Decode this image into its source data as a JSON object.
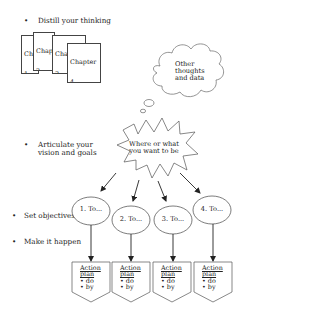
{
  "bullets": [
    {
      "label": "Distill your thinking"
    },
    {
      "label": "Articulate your",
      "label2": "vision and goals"
    },
    {
      "label": "Set objectives"
    },
    {
      "label": "Make it happen"
    }
  ],
  "bullet_glyph": "•",
  "chapters": [
    {
      "title": "Chapter",
      "number": "1",
      "lines": [
        "•",
        "•"
      ]
    },
    {
      "title": "Chapter",
      "number": "2",
      "lines": [
        "•",
        "•"
      ]
    },
    {
      "title": "Chapter",
      "number": "3",
      "lines": [
        "•",
        "•"
      ]
    },
    {
      "title": "Chapter",
      "number": "4",
      "notes": "Notes:",
      "lines": [
        "•"
      ]
    }
  ],
  "thought_cloud": {
    "line1": "Other",
    "line2": "thoughts",
    "line3": "and data"
  },
  "vision_burst": {
    "line1": "Where or what",
    "line2": "you want to be"
  },
  "objectives": [
    {
      "label": "1. To..."
    },
    {
      "label": "2. To..."
    },
    {
      "label": "3. To..."
    },
    {
      "label": "4. To..."
    }
  ],
  "action_plans": [
    {
      "title1": "Action",
      "title2": "plan",
      "item1": "• do",
      "item2": "• by"
    },
    {
      "title1": "Action",
      "title2": "plan",
      "item1": "• do",
      "item2": "• by"
    },
    {
      "title1": "Action",
      "title2": "plan",
      "item1": "• do",
      "item2": "• by"
    },
    {
      "title1": "Action",
      "title2": "plan",
      "item1": "• do",
      "item2": "• by"
    }
  ],
  "colors": {
    "stroke": "#444444",
    "text": "#222222",
    "background": "#ffffff"
  }
}
